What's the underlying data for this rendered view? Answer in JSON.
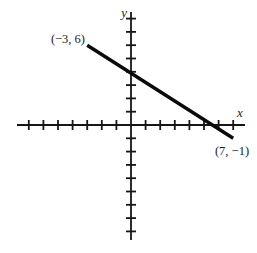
{
  "figure": {
    "background": "#ffffff",
    "ink": "#161616",
    "line_color": "#0a0a0a"
  },
  "chart_data": {
    "type": "line",
    "title": "",
    "xlabel": "x",
    "ylabel": "y",
    "points": [
      {
        "x": -3,
        "y": 6,
        "label": "(−3, 6)"
      },
      {
        "x": 7,
        "y": -1,
        "label": "(7, −1)"
      }
    ],
    "series": [
      {
        "name": "line-segment",
        "x": [
          -3,
          7
        ],
        "y": [
          6,
          -1
        ]
      }
    ],
    "x_ticks": {
      "min": -7,
      "max": 7,
      "step": 1
    },
    "y_ticks": {
      "min": -8,
      "max": 8,
      "step": 1
    },
    "grid": false,
    "axis_tick_labels_shown": false,
    "legend": null
  }
}
